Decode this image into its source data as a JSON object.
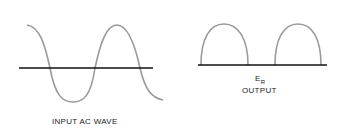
{
  "diagram": {
    "left": {
      "label": "INPUT AC WAVE",
      "waveform": "full sine",
      "wave_color": "#9a9a9a",
      "axis_color": "#111111"
    },
    "right": {
      "symbol_main": "E",
      "symbol_sub": "R",
      "label": "OUTPUT",
      "waveform": "half-wave rectified",
      "wave_color": "#9a9a9a",
      "axis_color": "#111111"
    }
  }
}
